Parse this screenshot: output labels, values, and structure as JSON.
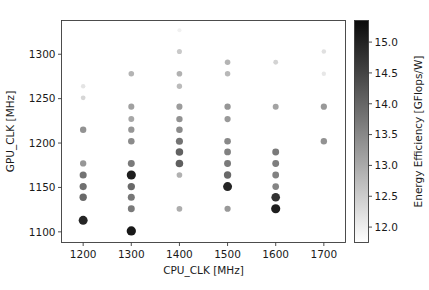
{
  "chart_data": {
    "type": "scatter",
    "title": "",
    "xlabel": "CPU_CLK [MHz]",
    "ylabel": "GPU_CLK [MHz]",
    "xlim": [
      1155,
      1745
    ],
    "ylim": [
      1088,
      1338
    ],
    "xticks": [
      1200,
      1300,
      1400,
      1500,
      1600,
      1700
    ],
    "yticks": [
      1100,
      1150,
      1200,
      1250,
      1300
    ],
    "grid": false,
    "legend": null,
    "colorbar": {
      "label": "Energy Efficiency [GFlops/W]",
      "ticks": [
        12.0,
        12.5,
        13.0,
        13.5,
        14.0,
        14.5,
        15.0
      ],
      "vmin": 11.75,
      "vmax": 15.35,
      "colormap": "Greys",
      "orientation": "vertical",
      "position": "right"
    },
    "point_encoding": {
      "color": "Energy Efficiency [GFlops/W]",
      "size": "Energy Efficiency [GFlops/W]"
    },
    "points": [
      {
        "x": 1200,
        "y": 1264,
        "v": 12.15
      },
      {
        "x": 1200,
        "y": 1251,
        "v": 12.35
      },
      {
        "x": 1200,
        "y": 1215,
        "v": 13.35
      },
      {
        "x": 1200,
        "y": 1177,
        "v": 13.3
      },
      {
        "x": 1200,
        "y": 1164,
        "v": 13.8
      },
      {
        "x": 1200,
        "y": 1151,
        "v": 13.85
      },
      {
        "x": 1200,
        "y": 1139,
        "v": 13.95
      },
      {
        "x": 1200,
        "y": 1113,
        "v": 14.95
      },
      {
        "x": 1300,
        "y": 1278,
        "v": 12.85
      },
      {
        "x": 1300,
        "y": 1241,
        "v": 13.15
      },
      {
        "x": 1300,
        "y": 1227,
        "v": 13.05
      },
      {
        "x": 1300,
        "y": 1215,
        "v": 13.3
      },
      {
        "x": 1300,
        "y": 1202,
        "v": 13.45
      },
      {
        "x": 1300,
        "y": 1177,
        "v": 13.7
      },
      {
        "x": 1300,
        "y": 1164,
        "v": 15.05
      },
      {
        "x": 1300,
        "y": 1151,
        "v": 13.95
      },
      {
        "x": 1300,
        "y": 1139,
        "v": 13.75
      },
      {
        "x": 1300,
        "y": 1126,
        "v": 13.7
      },
      {
        "x": 1300,
        "y": 1101,
        "v": 15.15
      },
      {
        "x": 1400,
        "y": 1327,
        "v": 11.95
      },
      {
        "x": 1400,
        "y": 1303,
        "v": 12.55
      },
      {
        "x": 1400,
        "y": 1278,
        "v": 12.9
      },
      {
        "x": 1400,
        "y": 1264,
        "v": 12.75
      },
      {
        "x": 1400,
        "y": 1241,
        "v": 13.2
      },
      {
        "x": 1400,
        "y": 1227,
        "v": 13.35
      },
      {
        "x": 1400,
        "y": 1215,
        "v": 13.45
      },
      {
        "x": 1400,
        "y": 1202,
        "v": 13.8
      },
      {
        "x": 1400,
        "y": 1190,
        "v": 14.05
      },
      {
        "x": 1400,
        "y": 1177,
        "v": 14.1
      },
      {
        "x": 1400,
        "y": 1164,
        "v": 12.9
      },
      {
        "x": 1400,
        "y": 1126,
        "v": 12.95
      },
      {
        "x": 1500,
        "y": 1291,
        "v": 12.85
      },
      {
        "x": 1500,
        "y": 1278,
        "v": 12.8
      },
      {
        "x": 1500,
        "y": 1241,
        "v": 13.3
      },
      {
        "x": 1500,
        "y": 1227,
        "v": 13.25
      },
      {
        "x": 1500,
        "y": 1202,
        "v": 13.5
      },
      {
        "x": 1500,
        "y": 1190,
        "v": 13.6
      },
      {
        "x": 1500,
        "y": 1177,
        "v": 13.7
      },
      {
        "x": 1500,
        "y": 1164,
        "v": 13.95
      },
      {
        "x": 1500,
        "y": 1151,
        "v": 14.95
      },
      {
        "x": 1500,
        "y": 1126,
        "v": 13.25
      },
      {
        "x": 1600,
        "y": 1291,
        "v": 12.4
      },
      {
        "x": 1600,
        "y": 1241,
        "v": 13.1
      },
      {
        "x": 1600,
        "y": 1190,
        "v": 13.7
      },
      {
        "x": 1600,
        "y": 1177,
        "v": 13.65
      },
      {
        "x": 1600,
        "y": 1164,
        "v": 13.6
      },
      {
        "x": 1600,
        "y": 1151,
        "v": 13.55
      },
      {
        "x": 1600,
        "y": 1139,
        "v": 14.75
      },
      {
        "x": 1600,
        "y": 1126,
        "v": 15.05
      },
      {
        "x": 1700,
        "y": 1303,
        "v": 12.2
      },
      {
        "x": 1700,
        "y": 1278,
        "v": 12.1
      },
      {
        "x": 1700,
        "y": 1241,
        "v": 13.25
      },
      {
        "x": 1700,
        "y": 1202,
        "v": 13.35
      }
    ]
  }
}
